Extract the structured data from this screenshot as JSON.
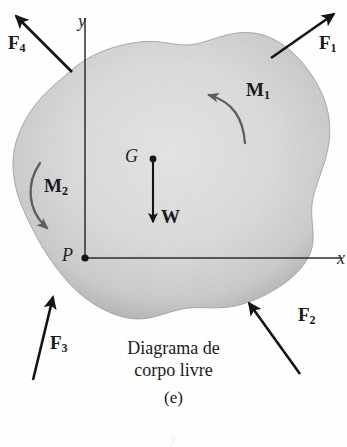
{
  "figure": {
    "label": "(e)",
    "caption_line1": "Diagrama de",
    "caption_line2": "corpo livre",
    "bleed_glyph": "y"
  },
  "axes": {
    "y_label": "y",
    "x_label": "x",
    "origin_label": "P"
  },
  "body": {
    "centroid_label": "G",
    "fill_color": "#d9d9d9",
    "edge_color": "#a9a9a9"
  },
  "forces": [
    {
      "name": "F1",
      "base": "F",
      "sub": "1",
      "label": "F₁"
    },
    {
      "name": "F2",
      "base": "F",
      "sub": "2",
      "label": "F₂"
    },
    {
      "name": "F3",
      "base": "F",
      "sub": "3",
      "label": "F₃"
    },
    {
      "name": "F4",
      "base": "F",
      "sub": "4",
      "label": "F₄"
    }
  ],
  "moments": [
    {
      "name": "M1",
      "base": "M",
      "sub": "1",
      "label": "M₁",
      "sense": "counterclockwise"
    },
    {
      "name": "M2",
      "base": "M",
      "sub": "2",
      "label": "M₂",
      "sense": "clockwise"
    }
  ],
  "weight": {
    "label": "W",
    "direction": "down"
  },
  "colors": {
    "ink": "#1a1a1a",
    "arrow": "#141414",
    "moment_arrow": "#5b5b5b",
    "background": "#ffffff"
  }
}
